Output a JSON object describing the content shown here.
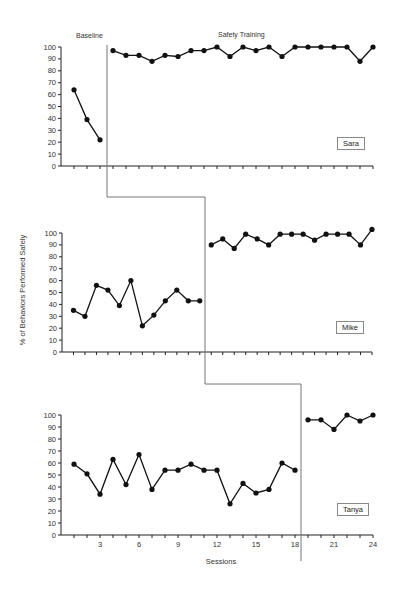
{
  "labels": {
    "baseline": "Baseline",
    "treatment": "Safety Training",
    "ylabel": "% of Behaviors Performed Safely",
    "xlabel": "Sessions"
  },
  "chart_data": {
    "type": "line",
    "title": "",
    "xlabel": "Sessions",
    "ylabel": "% of Behaviors Performed Safely",
    "xticks": [
      3,
      6,
      9,
      12,
      15,
      18,
      21,
      24
    ],
    "xlim": [
      0,
      24
    ],
    "yticks": [
      0,
      10,
      20,
      30,
      40,
      50,
      60,
      70,
      80,
      90,
      100
    ],
    "ylim": [
      0,
      100
    ],
    "grid": false,
    "phases": [
      "Baseline",
      "Safety Training"
    ],
    "panels": [
      {
        "participant": "Sara",
        "baseline": [
          64,
          39,
          22
        ],
        "treatment": [
          97,
          93,
          93,
          88,
          93,
          92,
          97,
          97,
          100,
          92,
          100,
          97,
          100,
          92,
          100,
          100,
          100,
          100,
          100,
          88,
          100
        ],
        "phase_change_after_session": 3
      },
      {
        "participant": "Mike",
        "baseline": [
          35,
          30,
          56,
          52,
          39,
          60,
          22,
          31,
          43,
          52,
          43,
          43
        ],
        "treatment": [
          90,
          95,
          87,
          99,
          95,
          90,
          99,
          99,
          99,
          94,
          99,
          99,
          99,
          90,
          103
        ],
        "phase_change_after_session": 12
      },
      {
        "participant": "Tanya",
        "baseline": [
          59,
          51,
          34,
          63,
          42,
          67,
          38,
          54,
          54,
          59,
          54,
          54,
          26,
          43,
          35,
          38,
          60,
          54
        ],
        "treatment": [
          96,
          96,
          88,
          100,
          95,
          100
        ],
        "phase_change_after_session": 18
      }
    ]
  },
  "layout": {
    "panels": [
      {
        "x0": 61,
        "x1": 373,
        "y0": 166,
        "y100": 47,
        "box": [
          337,
          137
        ],
        "phaseX": 107,
        "nsess": 24
      },
      {
        "x0": 62,
        "x1": 372,
        "y0": 352,
        "y100": 233,
        "box": [
          336,
          321
        ],
        "phaseX": 205,
        "nsess": 27
      },
      {
        "x0": 61,
        "x1": 373,
        "y0": 535,
        "y100": 415,
        "box": [
          337,
          503
        ],
        "phaseX": 301,
        "nsess": 24
      }
    ]
  }
}
